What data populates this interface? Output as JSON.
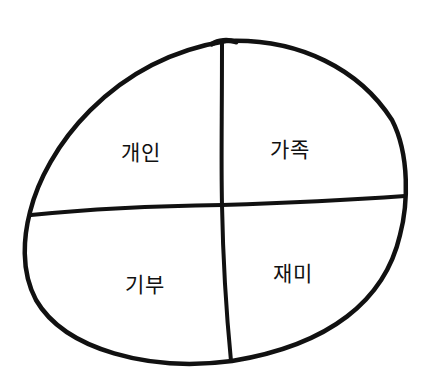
{
  "diagram": {
    "type": "hand-drawn quadrant oval",
    "stroke_color": "#111111",
    "background": "#ffffff",
    "quadrants": [
      {
        "position": "top-left",
        "label": "개인",
        "x": 141,
        "y": 151
      },
      {
        "position": "top-right",
        "label": "가족",
        "x": 290,
        "y": 148
      },
      {
        "position": "bottom-left",
        "label": "기부",
        "x": 145,
        "y": 283
      },
      {
        "position": "bottom-right",
        "label": "재미",
        "x": 293,
        "y": 272
      }
    ]
  }
}
